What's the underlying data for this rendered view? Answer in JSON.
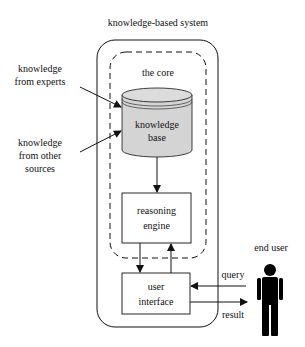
{
  "diagram": {
    "title": "knowledge-based system",
    "core_label": "the core",
    "inputs": [
      {
        "line1": "knowledge",
        "line2": "from experts"
      },
      {
        "line1": "knowledge",
        "line2": "from other",
        "line3": "sources"
      }
    ],
    "knowledge_base": {
      "line1": "knowledge",
      "line2": "base"
    },
    "reasoning_engine": {
      "line1": "reasoning",
      "line2": "engine"
    },
    "user_interface": {
      "line1": "user",
      "line2": "interface"
    },
    "end_user_label": "end user",
    "query_label": "query",
    "result_label": "result",
    "colors": {
      "stroke": "#111111",
      "cylinder_fill": "#d4d4d4",
      "background": "#ffffff"
    }
  }
}
